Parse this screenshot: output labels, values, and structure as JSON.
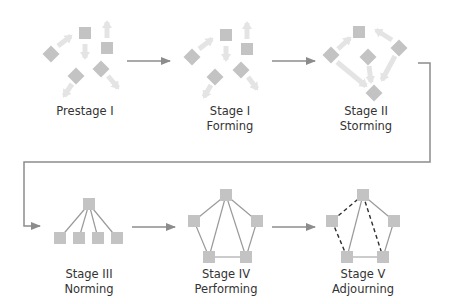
{
  "colors": {
    "node": "#c3c3c3",
    "node_faded": "#dcdcdc",
    "arrow_faded": "#e4e4e4",
    "edge": "#9a9a9a",
    "dashed_edge": "#2e2e2e",
    "connector": "#8c8c8c",
    "text": "#333333"
  },
  "stages": [
    {
      "id": "prestage-1",
      "line1": "Prestage I",
      "line2": "",
      "label_x": 30,
      "label_y": 104
    },
    {
      "id": "stage-1",
      "line1": "Stage I",
      "line2": "Forming",
      "label_x": 175,
      "label_y": 104
    },
    {
      "id": "stage-2",
      "line1": "Stage II",
      "line2": "Storming",
      "label_x": 311,
      "label_y": 104
    },
    {
      "id": "stage-3",
      "line1": "Stage III",
      "line2": "Norming",
      "label_x": 34,
      "label_y": 267
    },
    {
      "id": "stage-4",
      "line1": "Stage IV",
      "line2": "Performing",
      "label_x": 171,
      "label_y": 267
    },
    {
      "id": "stage-5",
      "line1": "Stage V",
      "line2": "Adjourning",
      "label_x": 308,
      "label_y": 267
    }
  ],
  "flow_arrows": [
    {
      "from": "prestage-1",
      "to": "stage-1",
      "x1": 127,
      "y1": 61,
      "x2": 170,
      "y2": 61
    },
    {
      "from": "stage-1",
      "to": "stage-2",
      "x1": 272,
      "y1": 61,
      "x2": 315,
      "y2": 61
    },
    {
      "from": "stage-3",
      "to": "stage-4",
      "x1": 132,
      "y1": 227,
      "x2": 175,
      "y2": 227
    },
    {
      "from": "stage-4",
      "to": "stage-5",
      "x1": 272,
      "y1": 227,
      "x2": 315,
      "y2": 227
    }
  ],
  "wrap_connector": {
    "from": "stage-2",
    "to": "stage-3",
    "points": [
      [
        418,
        63
      ],
      [
        430,
        63
      ],
      [
        430,
        162
      ],
      [
        24,
        162
      ],
      [
        24,
        226
      ],
      [
        40,
        226
      ]
    ]
  },
  "scatter_nodes": {
    "prestage-1": [
      {
        "x": 51,
        "y": 54,
        "rot": 45
      },
      {
        "x": 85,
        "y": 33,
        "rot": 0
      },
      {
        "x": 107,
        "y": 48,
        "rot": 0
      },
      {
        "x": 76,
        "y": 76,
        "rot": 45
      },
      {
        "x": 101,
        "y": 69,
        "rot": 45
      }
    ],
    "stage-1": [
      {
        "x": 192,
        "y": 57,
        "rot": 45
      },
      {
        "x": 226,
        "y": 35,
        "rot": 0
      },
      {
        "x": 247,
        "y": 49,
        "rot": 0
      },
      {
        "x": 215,
        "y": 77,
        "rot": 45
      },
      {
        "x": 241,
        "y": 70,
        "rot": 45
      }
    ],
    "stage-2": [
      {
        "x": 331,
        "y": 55,
        "rot": 45
      },
      {
        "x": 359,
        "y": 32,
        "rot": 0
      },
      {
        "x": 368,
        "y": 57,
        "rot": 45
      },
      {
        "x": 399,
        "y": 48,
        "rot": 45
      },
      {
        "x": 374,
        "y": 93,
        "rot": 45
      }
    ]
  },
  "scatter_arrows": {
    "prestage-1": [
      [
        58,
        46,
        71,
        36
      ],
      [
        85,
        44,
        85,
        58
      ],
      [
        107,
        38,
        107,
        22
      ],
      [
        72,
        84,
        64,
        96
      ],
      [
        108,
        76,
        118,
        88
      ]
    ],
    "stage-1": [
      [
        199,
        49,
        212,
        39
      ],
      [
        226,
        46,
        226,
        60
      ],
      [
        247,
        39,
        247,
        23
      ],
      [
        211,
        85,
        204,
        97
      ],
      [
        248,
        77,
        257,
        89
      ]
    ],
    "stage-2": [
      [
        338,
        49,
        350,
        38
      ],
      [
        392,
        40,
        376,
        30
      ],
      [
        337,
        62,
        366,
        86
      ],
      [
        395,
        56,
        382,
        80
      ],
      [
        369,
        66,
        371,
        82
      ]
    ]
  },
  "networks": {
    "stage-3": {
      "nodes": [
        [
          89,
          204
        ],
        [
          60,
          238
        ],
        [
          79,
          238
        ],
        [
          98,
          238
        ],
        [
          117,
          238
        ]
      ],
      "edges": [
        [
          0,
          1,
          "solid"
        ],
        [
          0,
          2,
          "solid"
        ],
        [
          0,
          3,
          "solid"
        ],
        [
          0,
          4,
          "solid"
        ]
      ]
    },
    "stage-4": {
      "nodes": [
        [
          226,
          195
        ],
        [
          194,
          221
        ],
        [
          257,
          221
        ],
        [
          209,
          257
        ],
        [
          246,
          257
        ]
      ],
      "edges": [
        [
          0,
          1,
          "solid"
        ],
        [
          0,
          2,
          "solid"
        ],
        [
          1,
          3,
          "solid"
        ],
        [
          2,
          4,
          "solid"
        ],
        [
          3,
          4,
          "solid"
        ],
        [
          0,
          3,
          "solid"
        ],
        [
          0,
          4,
          "solid"
        ]
      ]
    },
    "stage-5": {
      "nodes": [
        [
          363,
          195
        ],
        [
          332,
          221
        ],
        [
          394,
          221
        ],
        [
          347,
          257
        ],
        [
          383,
          257
        ]
      ],
      "edges": [
        [
          0,
          1,
          "dashed"
        ],
        [
          1,
          3,
          "dashed"
        ],
        [
          0,
          4,
          "dashed"
        ],
        [
          0,
          2,
          "solid"
        ],
        [
          2,
          4,
          "solid"
        ],
        [
          0,
          3,
          "solid"
        ],
        [
          3,
          4,
          "solid"
        ]
      ]
    }
  },
  "node_size": 12
}
